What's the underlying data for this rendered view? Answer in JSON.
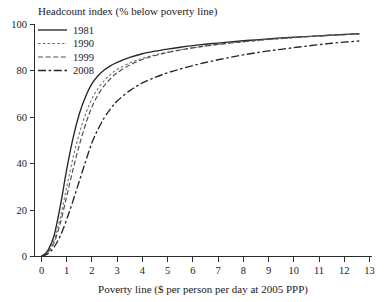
{
  "chart_data": {
    "type": "line",
    "title": "Headcount index (% below poverty line)",
    "xlabel": "Poverty line ($ per person per day at 2005 PPP)",
    "ylabel": "",
    "xlim": [
      0,
      13
    ],
    "ylim": [
      0,
      100
    ],
    "grid": false,
    "legend_position": "top-left",
    "xticks": [
      "0",
      "1",
      "2",
      "3",
      "4",
      "5",
      "6",
      "7",
      "8",
      "9",
      "10",
      "11",
      "12",
      "13"
    ],
    "yticks": [
      "0",
      "20",
      "40",
      "60",
      "80",
      "100"
    ],
    "x": [
      0,
      0.25,
      0.5,
      0.75,
      1,
      1.25,
      1.5,
      1.75,
      2,
      2.25,
      2.5,
      2.75,
      3,
      3.5,
      4,
      4.5,
      5,
      5.5,
      6,
      6.5,
      7,
      7.5,
      8,
      8.5,
      9,
      9.5,
      10,
      10.5,
      11,
      11.5,
      12,
      12.6
    ],
    "series": [
      {
        "name": "1981",
        "style": "solid",
        "color": "#262626",
        "values": [
          0,
          2.5,
          9,
          22,
          37.5,
          51,
          61.5,
          69,
          74.5,
          78,
          80.5,
          82.3,
          83.7,
          85.8,
          87.4,
          88.5,
          89.4,
          90.2,
          90.9,
          91.5,
          92.0,
          92.5,
          93.0,
          93.4,
          93.8,
          94.2,
          94.5,
          94.8,
          95.1,
          95.4,
          95.7,
          96.0
        ]
      },
      {
        "name": "1990",
        "style": "dashed-fine",
        "color": "#6e6e6e",
        "values": [
          0,
          2.0,
          7,
          17,
          30,
          42.5,
          53,
          61.5,
          68,
          72.5,
          76,
          78.6,
          80.6,
          83.4,
          85.4,
          86.9,
          88.1,
          89.1,
          90.0,
          90.7,
          91.4,
          92.0,
          92.5,
          93.0,
          93.5,
          93.9,
          94.3,
          94.7,
          95.0,
          95.3,
          95.6,
          95.9
        ]
      },
      {
        "name": "1999",
        "style": "dashed-med",
        "color": "#4a4a4a",
        "values": [
          0,
          1.8,
          6,
          14.5,
          26,
          37.5,
          48,
          57,
          64.5,
          69.8,
          73.8,
          76.8,
          79.2,
          82.5,
          84.9,
          86.6,
          87.9,
          89.0,
          89.9,
          90.7,
          91.4,
          92.0,
          92.6,
          93.1,
          93.6,
          94.0,
          94.4,
          94.8,
          95.1,
          95.4,
          95.7,
          96.0
        ]
      },
      {
        "name": "2008",
        "style": "dash-long",
        "color": "#262626",
        "values": [
          0,
          1.2,
          4,
          9,
          16,
          24,
          32.5,
          41,
          49,
          55,
          60,
          63.8,
          67,
          71.5,
          74.8,
          77.2,
          79.2,
          80.8,
          82.3,
          83.6,
          84.8,
          85.9,
          86.9,
          87.8,
          88.6,
          89.3,
          90.0,
          90.7,
          91.3,
          91.9,
          92.4,
          92.9
        ]
      }
    ]
  },
  "legend": {
    "items": [
      {
        "label": "1981"
      },
      {
        "label": "1990"
      },
      {
        "label": "1999"
      },
      {
        "label": "2008"
      }
    ]
  }
}
